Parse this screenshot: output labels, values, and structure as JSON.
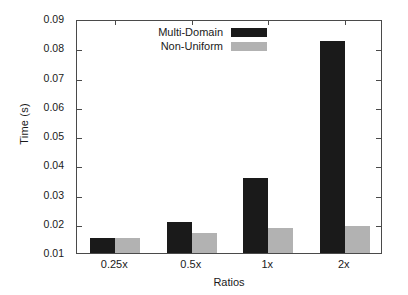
{
  "chart_data": {
    "type": "bar",
    "title": "",
    "xlabel": "Ratios",
    "ylabel": "Time (s)",
    "categories": [
      "0.25x",
      "0.5x",
      "1x",
      "2x"
    ],
    "series": [
      {
        "name": "Multi-Domain",
        "color": "#1a1a1a",
        "values": [
          0.015,
          0.0207,
          0.0357,
          0.0826
        ]
      },
      {
        "name": "Non-Uniform",
        "color": "#b2b2b2",
        "values": [
          0.0151,
          0.0167,
          0.0187,
          0.0191
        ]
      }
    ],
    "ylim": [
      0.01,
      0.09
    ],
    "ytick_labels": [
      "0.09",
      "0.08",
      "0.07",
      "0.06",
      "0.05",
      "0.04",
      "0.03",
      "0.02",
      "0.01"
    ],
    "ytick_values": [
      0.09,
      0.08,
      0.07,
      0.06,
      0.05,
      0.04,
      0.03,
      0.02,
      0.01
    ],
    "grid": false,
    "legend_position": "top-left"
  },
  "axes": {
    "y_title": "Time (s)",
    "x_title": "Ratios"
  },
  "legend": {
    "entries": [
      {
        "label": "Multi-Domain"
      },
      {
        "label": "Non-Uniform"
      }
    ]
  }
}
